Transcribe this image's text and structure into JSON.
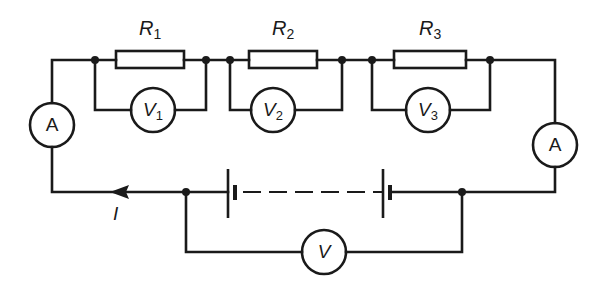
{
  "diagram": {
    "type": "electrical-circuit",
    "stroke_color": "#1a1a1a",
    "background": "#ffffff"
  },
  "resistors": [
    {
      "id": "R1",
      "symbol": "R",
      "subscript": "1"
    },
    {
      "id": "R2",
      "symbol": "R",
      "subscript": "2"
    },
    {
      "id": "R3",
      "symbol": "R",
      "subscript": "3"
    }
  ],
  "voltmeters": [
    {
      "id": "V1",
      "symbol": "V",
      "subscript": "1"
    },
    {
      "id": "V2",
      "symbol": "V",
      "subscript": "2"
    },
    {
      "id": "V3",
      "symbol": "V",
      "subscript": "3"
    },
    {
      "id": "V",
      "symbol": "V",
      "subscript": ""
    }
  ],
  "ammeters": [
    {
      "id": "A-left",
      "symbol": "A"
    },
    {
      "id": "A-right",
      "symbol": "A"
    }
  ],
  "current": {
    "symbol": "I",
    "direction": "left"
  },
  "battery": {
    "cells": 2,
    "dashed_connection": true
  }
}
